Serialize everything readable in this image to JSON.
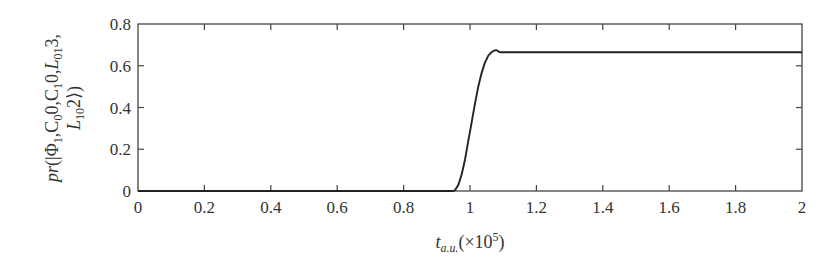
{
  "chart_data": {
    "type": "line",
    "title": "",
    "xlabel": "t_a.u. (×10^5)",
    "xlabel_parts": {
      "base": "t",
      "sub": "a.u.",
      "suffix": "(×10",
      "sup": "5",
      "close": ")"
    },
    "ylabel": "pr(|Φ1,C0 0,C1 0,L01 3, L10 2⟩)",
    "ylabel_line1": [
      {
        "t": "pr",
        "style": "italic"
      },
      {
        "t": "(|Φ"
      },
      {
        "t": "1",
        "sub": true
      },
      {
        "t": ",C"
      },
      {
        "t": "0",
        "sub": true
      },
      {
        "t": "0,C"
      },
      {
        "t": "1",
        "sub": true
      },
      {
        "t": "0,"
      },
      {
        "t": "L",
        "style": "italic"
      },
      {
        "t": "01",
        "sub": true
      },
      {
        "t": "3,"
      }
    ],
    "ylabel_line2": [
      {
        "t": "L",
        "style": "italic"
      },
      {
        "t": "10",
        "sub": true
      },
      {
        "t": "2⟩)"
      }
    ],
    "xlim": [
      0,
      2
    ],
    "ylim": [
      0,
      0.8
    ],
    "xticks": [
      0,
      0.2,
      0.4,
      0.6,
      0.8,
      1,
      1.2,
      1.4,
      1.6,
      1.8,
      2
    ],
    "xtick_labels": [
      "0",
      "0.2",
      "0.4",
      "0.6",
      "0.8",
      "1",
      "1.2",
      "1.4",
      "1.6",
      "1.8",
      "2"
    ],
    "yticks": [
      0,
      0.2,
      0.4,
      0.6,
      0.8
    ],
    "ytick_labels": [
      "0",
      "0.2",
      "0.4",
      "0.6",
      "0.8"
    ],
    "grid": false,
    "legend": null,
    "series": [
      {
        "name": "probability",
        "color": "#222222",
        "x": [
          0,
          0.95,
          0.955,
          0.965,
          0.975,
          0.985,
          0.995,
          1.005,
          1.015,
          1.025,
          1.035,
          1.045,
          1.055,
          1.065,
          1.072,
          1.078,
          1.083,
          1.088,
          1.095,
          1.2,
          1.4,
          1.6,
          1.8,
          2.0
        ],
        "y": [
          0,
          0,
          0.005,
          0.03,
          0.08,
          0.15,
          0.24,
          0.33,
          0.42,
          0.5,
          0.565,
          0.615,
          0.648,
          0.665,
          0.672,
          0.675,
          0.672,
          0.666,
          0.665,
          0.665,
          0.665,
          0.665,
          0.665,
          0.665
        ]
      }
    ]
  }
}
